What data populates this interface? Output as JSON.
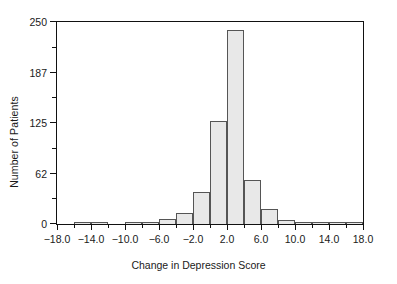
{
  "chart_data": {
    "type": "bar",
    "title": "",
    "xlabel": "Change in Depression Score",
    "ylabel": "Number of Patients",
    "xlim": [
      -18.0,
      18.0
    ],
    "ylim": [
      0,
      250
    ],
    "bin_width": 2,
    "grid": false,
    "legend": null,
    "y_ticks_major": [
      0,
      62,
      125,
      187,
      250
    ],
    "y_tick_labels": [
      "0",
      "62",
      "125",
      "187",
      "250"
    ],
    "y_ticks_minor": [
      31,
      93,
      156,
      218
    ],
    "x_ticks_major": [
      -18.0,
      -14.0,
      -10.0,
      -6.0,
      -2.0,
      2.0,
      6.0,
      10.0,
      14.0,
      18.0
    ],
    "x_tick_labels": [
      "−18.0",
      "−14.0",
      "−10.0",
      "−6.0",
      "−2.0",
      "2.0",
      "6.0",
      "10.0",
      "14.0",
      "18.0"
    ],
    "x_ticks_minor": [
      -16.0,
      -12.0,
      -8.0,
      -4.0,
      0.0,
      4.0,
      8.0,
      12.0,
      16.0
    ],
    "bins": [
      {
        "start": -18.0,
        "end": -16.0,
        "value": 0
      },
      {
        "start": -16.0,
        "end": -14.0,
        "value": 2
      },
      {
        "start": -14.0,
        "end": -12.0,
        "value": 2
      },
      {
        "start": -12.0,
        "end": -10.0,
        "value": 0
      },
      {
        "start": -10.0,
        "end": -8.0,
        "value": 2
      },
      {
        "start": -8.0,
        "end": -6.0,
        "value": 3
      },
      {
        "start": -6.0,
        "end": -4.0,
        "value": 6
      },
      {
        "start": -4.0,
        "end": -2.0,
        "value": 14
      },
      {
        "start": -2.0,
        "end": 0.0,
        "value": 40
      },
      {
        "start": 0.0,
        "end": 2.0,
        "value": 128
      },
      {
        "start": 2.0,
        "end": 4.0,
        "value": 240
      },
      {
        "start": 4.0,
        "end": 6.0,
        "value": 55
      },
      {
        "start": 6.0,
        "end": 8.0,
        "value": 18
      },
      {
        "start": 8.0,
        "end": 10.0,
        "value": 5
      },
      {
        "start": 10.0,
        "end": 12.0,
        "value": 2
      },
      {
        "start": 12.0,
        "end": 14.0,
        "value": 3
      },
      {
        "start": 14.0,
        "end": 16.0,
        "value": 2
      },
      {
        "start": 16.0,
        "end": 18.0,
        "value": 3
      }
    ],
    "colors": {
      "bar_fill": "#e8e8e8",
      "bar_edge": "#555555",
      "axis": "#111111",
      "text": "#1a1a1a",
      "background": "#ffffff"
    }
  }
}
